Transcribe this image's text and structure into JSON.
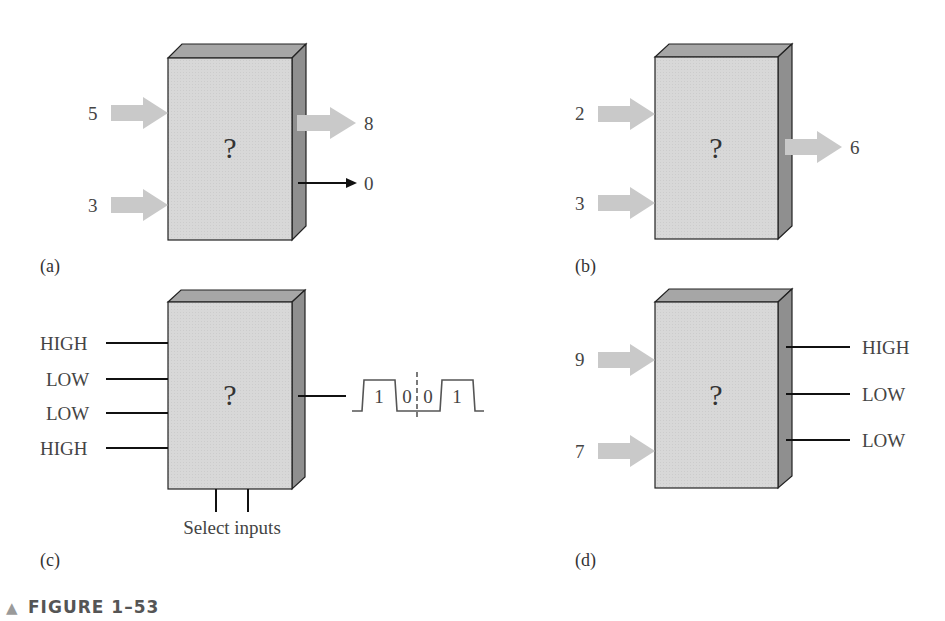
{
  "figure": {
    "title": "FIGURE 1–53",
    "marker": "▲"
  },
  "panels": {
    "a": {
      "caption": "(a)",
      "box_label": "?",
      "inputs": [
        "5",
        "3"
      ],
      "outputs": [
        {
          "label": "8",
          "type": "wide-arrow"
        },
        {
          "label": "0",
          "type": "line-arrow"
        }
      ]
    },
    "b": {
      "caption": "(b)",
      "box_label": "?",
      "inputs": [
        "2",
        "3"
      ],
      "outputs": [
        {
          "label": "6",
          "type": "wide-arrow"
        }
      ]
    },
    "c": {
      "caption": "(c)",
      "box_label": "?",
      "inputs": [
        "HIGH",
        "LOW",
        "LOW",
        "HIGH"
      ],
      "select_label": "Select inputs",
      "waveform_bits": [
        "1",
        "0",
        "0",
        "1"
      ]
    },
    "d": {
      "caption": "(d)",
      "box_label": "?",
      "inputs": [
        "9",
        "7"
      ],
      "outputs": [
        "HIGH",
        "LOW",
        "LOW"
      ]
    }
  },
  "colors": {
    "box_face": "#d6d6d6",
    "box_top": "#a4a4a4",
    "box_side": "#8e8e8e",
    "arrow": "#c8c8c8",
    "line": "#111111"
  }
}
